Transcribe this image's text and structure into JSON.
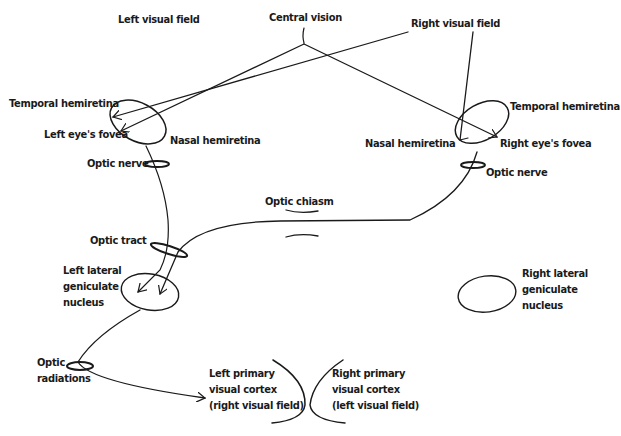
{
  "diagram": {
    "labels": {
      "left_visual_field": "Left visual field",
      "central_vision": "Central vision",
      "right_visual_field": "Right visual field",
      "left_temporal_hemiretina": "Temporal hemiretina",
      "left_eye_fovea": "Left eye's fovea",
      "left_nasal_hemiretina": "Nasal hemiretina",
      "right_temporal_hemiretina": "Temporal hemiretina",
      "right_nasal_hemiretina": "Nasal hemiretina",
      "right_eye_fovea": "Right eye's fovea",
      "left_optic_nerve": "Optic nerve",
      "right_optic_nerve": "Optic nerve",
      "optic_chiasm": "Optic chiasm",
      "optic_tract": "Optic tract",
      "left_lgn": [
        "Left lateral",
        "geniculate",
        "nucleus"
      ],
      "right_lgn": [
        "Right lateral",
        "geniculate",
        "nucleus"
      ],
      "optic_radiations": [
        "Optic",
        "radiations"
      ],
      "left_v1": [
        "Left primary",
        "visual cortex",
        "(right visual field)"
      ],
      "right_v1": [
        "Right primary",
        "visual cortex",
        "(left visual field)"
      ]
    },
    "stroke_color": "#1a1a1a",
    "background": "#ffffff"
  }
}
